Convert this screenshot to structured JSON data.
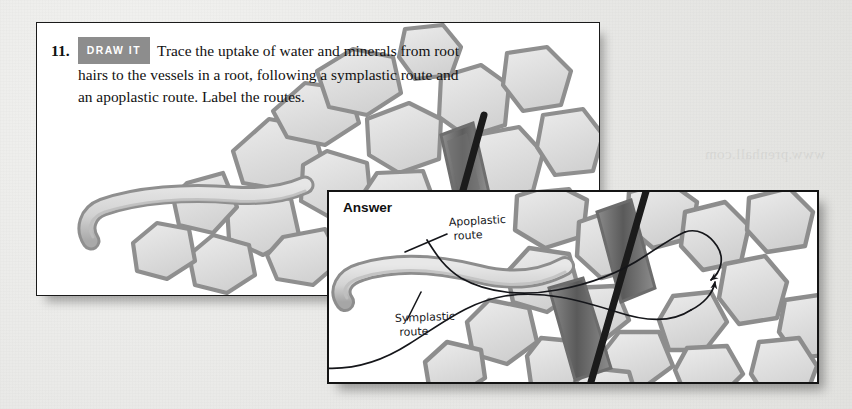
{
  "page": {
    "background_color": "#e8e8e6",
    "ghost_text": "www.prenhall.com"
  },
  "question_panel": {
    "number": "11.",
    "badge": "DRAW IT",
    "lines": [
      "Trace the uptake of water and minerals from root",
      "hairs to the vessels in a root, following a symplastic route and",
      "an apoplastic route. Label the routes."
    ],
    "badge_color": "#8d8d8d",
    "border_color": "#1a1a1a"
  },
  "answer_panel": {
    "title": "Answer",
    "border_color": "#141414",
    "annotations": [
      {
        "name": "apoplastic-route-label",
        "line1": "Apoplastic",
        "line2": "route"
      },
      {
        "name": "symplastic-route-label",
        "line1": "Symplastic",
        "line2": "route"
      }
    ]
  },
  "figure": {
    "type": "biology-diagram",
    "elements": [
      "root-hair-cell",
      "cortex-cell-tissue",
      "xylem-vessel-element",
      "apoplastic-route-path",
      "symplastic-route-path",
      "route-arrows"
    ],
    "palette": {
      "cell_fill": "#dedede",
      "cell_wall": "#9a9a9a",
      "cell_wall_dark": "#7c7c7c",
      "vessel_dark": "#6a6a6a",
      "vessel_stripe": "#1b1b1b",
      "ink": "#15161a"
    }
  }
}
